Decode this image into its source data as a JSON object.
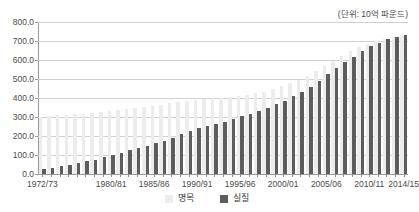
{
  "title": "",
  "unit_caption": "(단위: 10억 파운드)",
  "legend": {
    "nominal_label": "명목",
    "real_label": "실질",
    "nominal_color": "#ececec",
    "real_color": "#5d5d5d"
  },
  "chart_data": {
    "type": "bar",
    "title": "",
    "subtitle": "(단위: 10억 파운드)",
    "xlabel": "",
    "ylabel": "",
    "ylim": [
      0,
      800
    ],
    "ytick_step": 100,
    "ytick_labels": [
      "0.0",
      "100.0",
      "200.0",
      "300.0",
      "400.0",
      "500.0",
      "600.0",
      "700.0",
      "800.0"
    ],
    "ytick_values": [
      0,
      100,
      200,
      300,
      400,
      500,
      600,
      700,
      800
    ],
    "grid": true,
    "legend_position": "bottom-center",
    "categories": [
      "1972/73",
      "1973/74",
      "1974/75",
      "1975/76",
      "1976/77",
      "1977/78",
      "1978/79",
      "1979/80",
      "1980/81",
      "1981/82",
      "1982/83",
      "1983/84",
      "1984/85",
      "1985/86",
      "1986/87",
      "1987/88",
      "1988/89",
      "1989/90",
      "1990/91",
      "1991/92",
      "1992/93",
      "1993/94",
      "1994/95",
      "1995/96",
      "1996/97",
      "1997/98",
      "1998/99",
      "1999/00",
      "2000/01",
      "2001/02",
      "2002/03",
      "2003/04",
      "2004/05",
      "2005/06",
      "2006/07",
      "2007/08",
      "2008/09",
      "2009/10",
      "2010/11",
      "2011/12",
      "2012/13",
      "2013/14",
      "2014/15"
    ],
    "visible_xtick_labels": [
      "1972/73",
      "1980/81",
      "1985/86",
      "1990/91",
      "1995/96",
      "2000/01",
      "2005/06",
      "2010/11",
      "2014/15"
    ],
    "visible_xtick_indices": [
      0,
      8,
      13,
      18,
      23,
      28,
      33,
      38,
      42
    ],
    "series": [
      {
        "name": "명목",
        "color": "#ececec",
        "values": [
          300,
          305,
          308,
          312,
          315,
          318,
          320,
          325,
          330,
          336,
          340,
          346,
          352,
          358,
          364,
          372,
          380,
          386,
          392,
          396,
          398,
          400,
          404,
          410,
          416,
          424,
          434,
          446,
          462,
          478,
          496,
          516,
          540,
          566,
          594,
          622,
          648,
          668,
          686,
          700,
          712,
          722,
          726
        ]
      },
      {
        "name": "실질",
        "color": "#5d5d5d",
        "values": [
          26,
          32,
          40,
          50,
          58,
          66,
          76,
          88,
          100,
          112,
          124,
          136,
          148,
          162,
          176,
          192,
          208,
          224,
          240,
          252,
          264,
          276,
          290,
          304,
          318,
          332,
          348,
          366,
          386,
          408,
          432,
          460,
          492,
          524,
          556,
          588,
          618,
          646,
          672,
          692,
          708,
          720,
          732
        ]
      }
    ]
  }
}
